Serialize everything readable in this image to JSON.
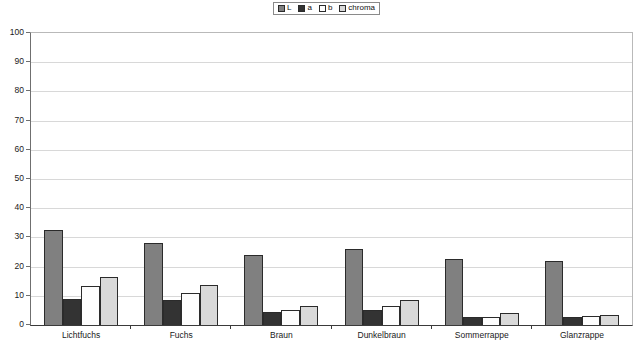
{
  "chart_data": {
    "type": "bar",
    "title": "",
    "xlabel": "",
    "ylabel": "",
    "ylim": [
      0,
      100
    ],
    "ytick_step": 10,
    "yticks": [
      100,
      90,
      80,
      70,
      60,
      50,
      40,
      30,
      20,
      10,
      0
    ],
    "grid": true,
    "legend_position": "top-center",
    "categories": [
      "Lichtfuchs",
      "Fuchs",
      "Braun",
      "Dunkelbraun",
      "Sommerrappe",
      "Glanzrappe"
    ],
    "series": [
      {
        "name": "L",
        "color": "#808080",
        "values": [
          32.5,
          28.0,
          24.0,
          26.0,
          22.5,
          22.0
        ]
      },
      {
        "name": "a",
        "color": "#333333",
        "values": [
          9.0,
          8.5,
          4.3,
          5.2,
          2.6,
          2.6
        ]
      },
      {
        "name": "b",
        "color": "#fdfdfd",
        "values": [
          13.3,
          11.0,
          5.0,
          6.4,
          2.8,
          3.2
        ]
      },
      {
        "name": "chroma",
        "color": "#d9d9d9",
        "values": [
          16.5,
          13.8,
          6.5,
          8.4,
          4.0,
          3.6
        ]
      }
    ]
  }
}
